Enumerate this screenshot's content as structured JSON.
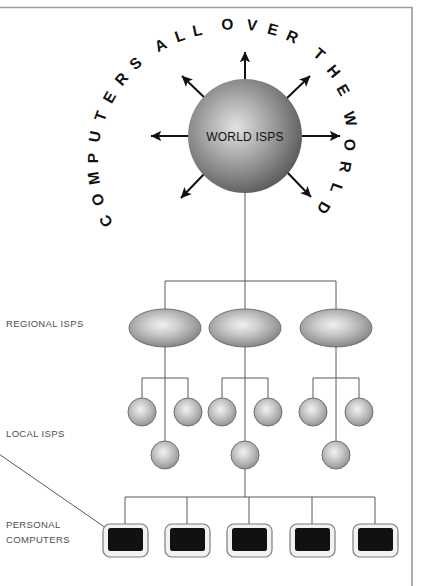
{
  "diagram": {
    "frame": {
      "color": "#9a9a9a"
    },
    "ring_text": {
      "full": "COMPUTERS ALL OVER THE WORLD",
      "letters": [
        "C",
        "O",
        "M",
        "P",
        "U",
        "T",
        "E",
        "R",
        "S",
        "A",
        "L",
        "L",
        "O",
        "V",
        "E",
        "R",
        "T",
        "H",
        "E",
        "W",
        "O",
        "R",
        "L",
        "D"
      ]
    },
    "hub": {
      "label": "WORLD ISPS",
      "shape": "sphere",
      "arrow_count": 7,
      "arrow_style": "double-headed"
    },
    "tiers": [
      {
        "name": "regional",
        "label": "REGIONAL ISPS",
        "shape": "ellipse",
        "count": 3
      },
      {
        "name": "local",
        "label": "LOCAL ISPS",
        "shape": "sphere",
        "count": 9
      },
      {
        "name": "personal",
        "label": "PERSONAL\nCOMPUTERS",
        "label_line1": "PERSONAL",
        "label_line2": "COMPUTERS",
        "shape": "monitor",
        "count": 5
      }
    ],
    "colors": {
      "wire": "#58585a",
      "arrow": "#111111",
      "label_text": "#4d4d4d",
      "sphere_light": "#e8e8e8",
      "sphere_mid": "#9a9a9a",
      "sphere_dark": "#555555",
      "monitor_screen": "#111111",
      "monitor_bezel": "#f2f2f2"
    }
  }
}
